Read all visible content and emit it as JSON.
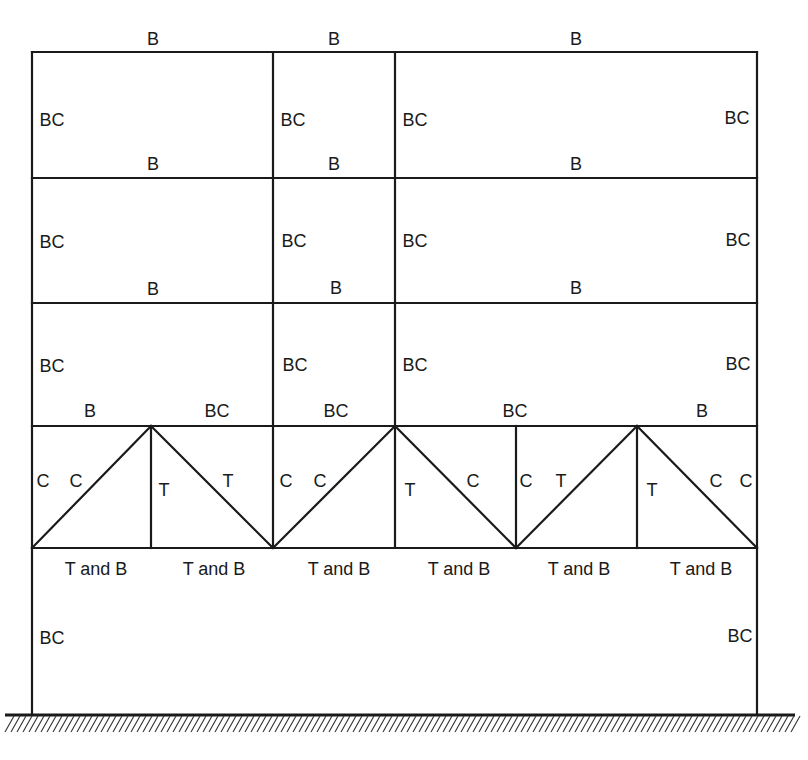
{
  "colors": {
    "line": "#1a1a1a",
    "background": "#ffffff"
  },
  "frame": {
    "columns_x": [
      32,
      273,
      395,
      757
    ],
    "floors_y": [
      52,
      178,
      303,
      426,
      548
    ],
    "base_y": 714
  },
  "truss": {
    "top_y": 426,
    "bottom_y": 548,
    "verticals_x": [
      151,
      516,
      637
    ],
    "diagonals": [
      [
        32,
        548,
        151,
        426
      ],
      [
        151,
        426,
        273,
        548
      ],
      [
        273,
        548,
        395,
        426
      ],
      [
        395,
        426,
        516,
        548
      ],
      [
        516,
        548,
        637,
        426
      ],
      [
        637,
        426,
        757,
        548
      ]
    ]
  },
  "ground": {
    "x1": 5,
    "x2": 795,
    "y": 715,
    "hatch_depth": 17
  },
  "labels": [
    {
      "text": "B",
      "x": 153,
      "y": 39
    },
    {
      "text": "B",
      "x": 334,
      "y": 39
    },
    {
      "text": "B",
      "x": 576,
      "y": 39
    },
    {
      "text": "BC",
      "x": 52,
      "y": 120
    },
    {
      "text": "BC",
      "x": 293,
      "y": 120
    },
    {
      "text": "BC",
      "x": 415,
      "y": 120
    },
    {
      "text": "BC",
      "x": 737,
      "y": 118
    },
    {
      "text": "B",
      "x": 153,
      "y": 164
    },
    {
      "text": "B",
      "x": 334,
      "y": 164
    },
    {
      "text": "B",
      "x": 576,
      "y": 164
    },
    {
      "text": "BC",
      "x": 52,
      "y": 242
    },
    {
      "text": "BC",
      "x": 294,
      "y": 241
    },
    {
      "text": "BC",
      "x": 415,
      "y": 241
    },
    {
      "text": "BC",
      "x": 738,
      "y": 240
    },
    {
      "text": "B",
      "x": 153,
      "y": 289
    },
    {
      "text": "B",
      "x": 336,
      "y": 288
    },
    {
      "text": "B",
      "x": 576,
      "y": 288
    },
    {
      "text": "BC",
      "x": 52,
      "y": 366
    },
    {
      "text": "BC",
      "x": 295,
      "y": 365
    },
    {
      "text": "BC",
      "x": 415,
      "y": 365
    },
    {
      "text": "BC",
      "x": 738,
      "y": 364
    },
    {
      "text": "B",
      "x": 90,
      "y": 411
    },
    {
      "text": "BC",
      "x": 217,
      "y": 411
    },
    {
      "text": "BC",
      "x": 336,
      "y": 411
    },
    {
      "text": "BC",
      "x": 515,
      "y": 411
    },
    {
      "text": "B",
      "x": 702,
      "y": 411
    },
    {
      "text": "C",
      "x": 43,
      "y": 481
    },
    {
      "text": "C",
      "x": 76,
      "y": 481
    },
    {
      "text": "T",
      "x": 164,
      "y": 490
    },
    {
      "text": "T",
      "x": 228,
      "y": 481
    },
    {
      "text": "C",
      "x": 286,
      "y": 481
    },
    {
      "text": "C",
      "x": 320,
      "y": 481
    },
    {
      "text": "T",
      "x": 410,
      "y": 490
    },
    {
      "text": "C",
      "x": 473,
      "y": 481
    },
    {
      "text": "C",
      "x": 526,
      "y": 481
    },
    {
      "text": "T",
      "x": 561,
      "y": 481
    },
    {
      "text": "T",
      "x": 652,
      "y": 490
    },
    {
      "text": "C",
      "x": 716,
      "y": 481
    },
    {
      "text": "C",
      "x": 746,
      "y": 481
    },
    {
      "text": "T and B",
      "x": 96,
      "y": 569
    },
    {
      "text": "T and B",
      "x": 214,
      "y": 569
    },
    {
      "text": "T and B",
      "x": 339,
      "y": 569
    },
    {
      "text": "T and B",
      "x": 459,
      "y": 569
    },
    {
      "text": "T and B",
      "x": 579,
      "y": 569
    },
    {
      "text": "T and B",
      "x": 701,
      "y": 569
    },
    {
      "text": "BC",
      "x": 52,
      "y": 638
    },
    {
      "text": "BC",
      "x": 740,
      "y": 636
    }
  ]
}
